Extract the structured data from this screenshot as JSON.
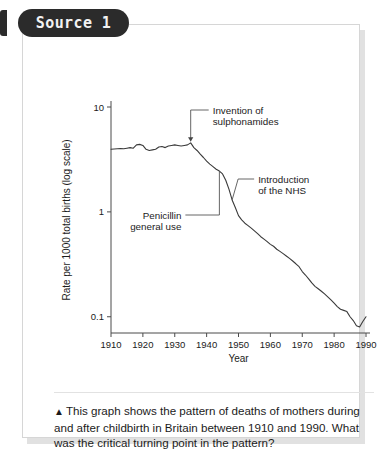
{
  "source": {
    "pill_label": "Source 1"
  },
  "caption": {
    "marker": "▲",
    "text": "This graph shows the pattern of deaths of mothers during and after childbirth in Britain between 1910 and 1990. What was the critical turning point in the pattern?"
  },
  "chart_data": {
    "type": "line",
    "title": "",
    "xlabel": "Year",
    "ylabel": "Rate per 1000 total births (log scale)",
    "yscale": "log",
    "xlim": [
      1910,
      1990
    ],
    "ylim": [
      0.07,
      10
    ],
    "grid": false,
    "legend": null,
    "xticks": [
      1910,
      1920,
      1930,
      1940,
      1950,
      1960,
      1970,
      1980,
      1990
    ],
    "xtick_labels": [
      "1910",
      "1920",
      "1930",
      "1940",
      "1950",
      "1960",
      "1970",
      "1980",
      "1990"
    ],
    "yticks": [
      10,
      1,
      0.1
    ],
    "ytick_labels": [
      "10",
      "1",
      "0.1"
    ],
    "series": [
      {
        "name": "Maternal mortality rate",
        "color": "#3a3a3a",
        "x": [
          1910,
          1911,
          1912,
          1913,
          1914,
          1915,
          1916,
          1917,
          1918,
          1919,
          1920,
          1921,
          1922,
          1923,
          1924,
          1925,
          1926,
          1927,
          1928,
          1929,
          1930,
          1931,
          1932,
          1933,
          1934,
          1935,
          1936,
          1937,
          1938,
          1939,
          1940,
          1941,
          1942,
          1943,
          1944,
          1945,
          1946,
          1947,
          1948,
          1949,
          1950,
          1951,
          1952,
          1953,
          1954,
          1955,
          1956,
          1957,
          1958,
          1959,
          1960,
          1961,
          1962,
          1963,
          1964,
          1965,
          1966,
          1967,
          1968,
          1969,
          1970,
          1971,
          1972,
          1973,
          1974,
          1975,
          1976,
          1977,
          1978,
          1979,
          1980,
          1981,
          1982,
          1983,
          1984,
          1985,
          1986,
          1987,
          1988,
          1989,
          1990
        ],
        "y": [
          3.95,
          3.98,
          4.0,
          4.02,
          4.0,
          4.05,
          4.1,
          4.05,
          4.35,
          4.4,
          4.3,
          3.95,
          3.85,
          3.9,
          3.95,
          4.15,
          4.2,
          4.1,
          4.25,
          4.3,
          4.35,
          4.3,
          4.25,
          4.3,
          4.35,
          4.55,
          4.1,
          3.85,
          3.55,
          3.3,
          3.05,
          2.85,
          2.7,
          2.55,
          2.45,
          2.3,
          2.0,
          1.65,
          1.3,
          1.1,
          0.92,
          0.84,
          0.78,
          0.74,
          0.7,
          0.66,
          0.62,
          0.58,
          0.55,
          0.52,
          0.49,
          0.47,
          0.44,
          0.42,
          0.4,
          0.38,
          0.36,
          0.34,
          0.32,
          0.3,
          0.27,
          0.25,
          0.23,
          0.21,
          0.195,
          0.185,
          0.175,
          0.165,
          0.155,
          0.145,
          0.135,
          0.125,
          0.118,
          0.115,
          0.112,
          0.1,
          0.092,
          0.082,
          0.08,
          0.09,
          0.1
        ]
      }
    ],
    "annotations": [
      {
        "id": "sulphonamides",
        "label_line1": "Invention of",
        "label_line2": "sulphonamides",
        "year": 1935,
        "value": 4.55
      },
      {
        "id": "nhs",
        "label_line1": "Introduction",
        "label_line2": "of the NHS",
        "year": 1948,
        "value": 1.3
      },
      {
        "id": "penicillin",
        "label_line1": "Penicillin",
        "label_line2": "general use",
        "year": 1944,
        "value": 2.45
      }
    ]
  }
}
